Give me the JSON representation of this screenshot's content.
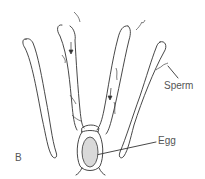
{
  "figure": {
    "panel_label": "B",
    "labels": {
      "sperm": "Sperm",
      "egg": "Egg"
    },
    "colors": {
      "line": "#333333",
      "text": "#555555",
      "egg_fill": "#d9d9d9"
    }
  }
}
